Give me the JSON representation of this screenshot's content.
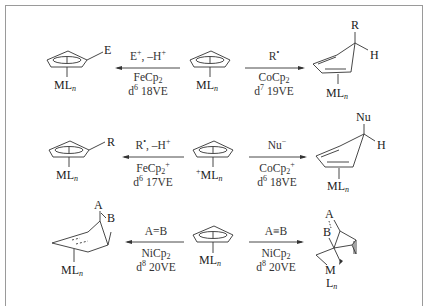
{
  "diagram": {
    "type": "reaction-scheme",
    "rows": [
      {
        "center": {
          "ligand": "ML",
          "sub": "n",
          "charge": ""
        },
        "left": {
          "reagent": "E",
          "reagent_sup": "+",
          "reagent_rest": ", –H",
          "reagent_rest_sup": "+",
          "complex": "FeCp",
          "complex_sub": "2",
          "complex_sup": "",
          "d": "d",
          "d_sup": "6",
          "ve": " 18VE",
          "product_substituent": "E",
          "product_ligand": "ML",
          "product_sub": "n"
        },
        "right": {
          "reagent": "R",
          "reagent_sup": "•",
          "reagent_rest": "",
          "reagent_rest_sup": "",
          "complex": "CoCp",
          "complex_sub": "2",
          "complex_sup": "",
          "d": "d",
          "d_sup": "7",
          "ve": " 19VE",
          "product_top": "R",
          "product_h": "H",
          "product_ligand": "ML",
          "product_sub": "n"
        }
      },
      {
        "center": {
          "ligand": "ML",
          "sub": "n",
          "charge": "+"
        },
        "left": {
          "reagent": "R",
          "reagent_sup": "•",
          "reagent_rest": ", –H",
          "reagent_rest_sup": "+",
          "complex": "FeCp",
          "complex_sub": "2",
          "complex_sup": "+",
          "d": "d",
          "d_sup": "6",
          "ve": " 17VE",
          "product_substituent": "R",
          "product_ligand": "ML",
          "product_sub": "n"
        },
        "right": {
          "reagent": "Nu",
          "reagent_sup": "−",
          "reagent_rest": "",
          "reagent_rest_sup": "",
          "complex": "CoCp",
          "complex_sub": "2",
          "complex_sup": "+",
          "d": "d",
          "d_sup": "6",
          "ve": " 18VE",
          "product_top": "Nu",
          "product_h": "H",
          "product_ligand": "ML",
          "product_sub": "n"
        }
      },
      {
        "center": {
          "ligand": "ML",
          "sub": "n",
          "charge": ""
        },
        "left": {
          "reagent": "A=B",
          "reagent_sup": "",
          "reagent_rest": "",
          "reagent_rest_sup": "",
          "complex": "NiCp",
          "complex_sub": "2",
          "complex_sup": "",
          "d": "d",
          "d_sup": "8",
          "ve": " 20VE",
          "product_a": "A",
          "product_b": "B",
          "product_ligand": "ML",
          "product_sub": "n"
        },
        "right": {
          "reagent": "A≡B",
          "reagent_sup": "",
          "reagent_rest": "",
          "reagent_rest_sup": "",
          "complex": "NiCp",
          "complex_sub": "2",
          "complex_sup": "",
          "d": "d",
          "d_sup": "8",
          "ve": " 20VE",
          "product_a": "A",
          "product_b": "B",
          "product_m": "M",
          "product_l": "L",
          "product_sub": "n"
        }
      }
    ],
    "colors": {
      "line": "#333333",
      "frame": "#9a9a9a",
      "text": "#222222"
    }
  }
}
